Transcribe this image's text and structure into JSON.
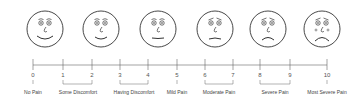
{
  "faces": [
    {
      "name": "no-pain-face",
      "cx": 45,
      "mood": "happy"
    },
    {
      "name": "some-discomfort-face",
      "cx": 101,
      "mood": "smile"
    },
    {
      "name": "having-discomfort-face",
      "cx": 158,
      "mood": "neutral"
    },
    {
      "name": "moderate-pain-face",
      "cx": 215,
      "mood": "worried"
    },
    {
      "name": "severe-pain-face",
      "cx": 268,
      "mood": "sad"
    },
    {
      "name": "most-severe-pain-face",
      "cx": 322,
      "mood": "crying"
    }
  ],
  "ticks": [
    {
      "value": "0",
      "x": 33
    },
    {
      "value": "1",
      "x": 63
    },
    {
      "value": "2",
      "x": 92
    },
    {
      "value": "3",
      "x": 120
    },
    {
      "value": "4",
      "x": 148
    },
    {
      "value": "5",
      "x": 177
    },
    {
      "value": "6",
      "x": 205
    },
    {
      "value": "7",
      "x": 233
    },
    {
      "value": "8",
      "x": 260
    },
    {
      "value": "9",
      "x": 290
    },
    {
      "value": "10",
      "x": 327
    }
  ],
  "labels": [
    {
      "text": "No Pain",
      "x": 33
    },
    {
      "text": "Some Discomfort",
      "x": 78
    },
    {
      "text": "Having Discomfort",
      "x": 134
    },
    {
      "text": "Mild Pain",
      "x": 177
    },
    {
      "text": "Moderate Pain",
      "x": 219
    },
    {
      "text": "Severe Pain",
      "x": 275
    },
    {
      "text": "Most Severe Pain",
      "x": 327
    }
  ],
  "brackets": [
    {
      "from": 63,
      "to": 92
    },
    {
      "from": 120,
      "to": 148
    },
    {
      "from": 205,
      "to": 233
    },
    {
      "from": 260,
      "to": 290
    }
  ],
  "colors": {
    "line": "#666666",
    "face": "#333333"
  }
}
